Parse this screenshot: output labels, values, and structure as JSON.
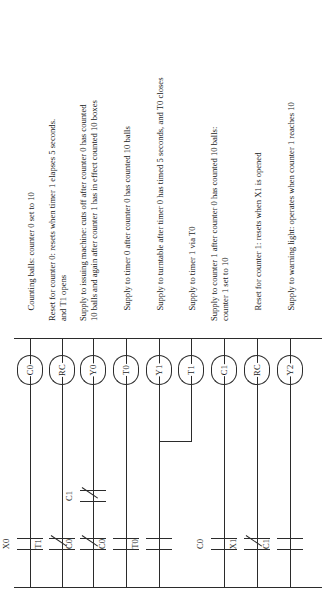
{
  "figure": {
    "type": "ladder-logic-diagram",
    "orientation": "rotated-90-ccw",
    "line_color": "#2b2b2b",
    "background": "#ffffff"
  },
  "rails": {
    "left_label": "",
    "right_label": ""
  },
  "rungs": [
    {
      "id": "rung-1",
      "coil": "C0",
      "contacts": [
        {
          "label": "X0",
          "type": "NO"
        }
      ],
      "note_line1": "Counting balls:  counter 0 set to 10",
      "note_line2": ""
    },
    {
      "id": "rung-2",
      "coil": "RC",
      "contacts": [
        {
          "label": "T1",
          "type": "NC"
        }
      ],
      "note_line1": "Reset for counter 0:  resets when timer 1 elapses 5 seconds.",
      "note_line2": "and T1 opens"
    },
    {
      "id": "rung-3",
      "coil": "Y0",
      "contacts": [
        {
          "label": "C0",
          "type": "NC"
        },
        {
          "label": "C1",
          "type": "NC"
        }
      ],
      "note_line1": "Supply to issuing machine:  cuts off after counter 0 has counted",
      "note_line2": "10 balls and again after counter 1 has in effect counted  10 boxes"
    },
    {
      "id": "rung-4",
      "coil": "T0",
      "contacts": [
        {
          "label": "C0",
          "type": "NO"
        }
      ],
      "note_line1": "Supply to timer 0 after counter 0 has counted 10 balls",
      "note_line2": ""
    },
    {
      "id": "rung-5",
      "coil": "Y1",
      "contacts": [
        {
          "label": "T0",
          "type": "NO"
        }
      ],
      "note_line1": "Supply to turntable after timer 0 has timed 5 seconds, and T0 closes",
      "note_line2": ""
    },
    {
      "id": "rung-6",
      "coil": "T1",
      "contacts": [],
      "note_line1": "Supply to timer 1 via T0",
      "note_line2": ""
    },
    {
      "id": "rung-7",
      "coil": "C1",
      "contacts": [
        {
          "label": "C0",
          "type": "NO"
        }
      ],
      "note_line1": "Supply to counter 1 after counter 0 has counted 10 balls:",
      "note_line2": "counter 1 set to 10"
    },
    {
      "id": "rung-8",
      "coil": "RC",
      "contacts": [
        {
          "label": "X1",
          "type": "NC"
        }
      ],
      "note_line1": "Reset for counter 1:  resets when X1 is opened",
      "note_line2": ""
    },
    {
      "id": "rung-9",
      "coil": "Y2",
      "contacts": [
        {
          "label": "C1",
          "type": "NO"
        }
      ],
      "note_line1": "Supply to warning light:  operates when counter 1 reaches 10",
      "note_line2": ""
    }
  ],
  "branches": [
    {
      "id": "branch-y1-t1",
      "from_rung": "rung-5",
      "to_rung": "rung-6"
    }
  ]
}
